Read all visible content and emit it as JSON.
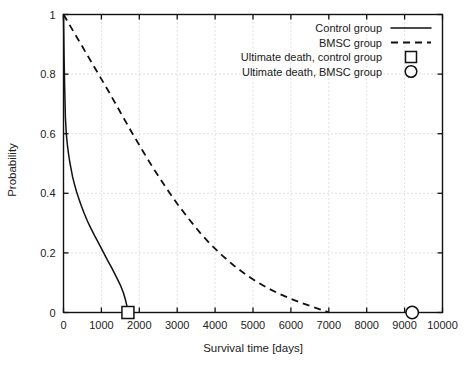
{
  "chart_data": {
    "type": "line",
    "title": "",
    "xlabel": "Survival time [days]",
    "ylabel": "Probability",
    "xlim": [
      0,
      10000
    ],
    "ylim": [
      0,
      1
    ],
    "grid": true,
    "legend_position": "top-right",
    "xticks": [
      0,
      1000,
      2000,
      3000,
      4000,
      5000,
      6000,
      7000,
      8000,
      9000,
      10000
    ],
    "xtick_labels": [
      "0",
      "1000",
      "2000",
      "3000",
      "4000",
      "5000",
      "6000",
      "7000",
      "8000",
      "9000",
      "10000"
    ],
    "yticks": [
      0,
      0.2,
      0.4,
      0.6,
      0.8,
      1
    ],
    "ytick_labels": [
      "0",
      "0.2",
      "0.4",
      "0.6",
      "0.8",
      "1"
    ],
    "series": [
      {
        "name": "Control group",
        "style": "solid",
        "x": [
          0,
          15,
          30,
          50,
          75,
          100,
          130,
          165,
          200,
          240,
          290,
          345,
          405,
          470,
          545,
          630,
          720,
          820,
          930,
          1040,
          1160,
          1280,
          1400,
          1500,
          1580,
          1640,
          1680,
          1700
        ],
        "y": [
          1.0,
          0.86,
          0.76,
          0.655,
          0.598,
          0.565,
          0.535,
          0.505,
          0.482,
          0.455,
          0.43,
          0.405,
          0.382,
          0.358,
          0.333,
          0.307,
          0.283,
          0.258,
          0.232,
          0.205,
          0.176,
          0.148,
          0.118,
          0.092,
          0.066,
          0.04,
          0.018,
          0.0
        ]
      },
      {
        "name": "BMSC group",
        "style": "dashed",
        "x": [
          0,
          300,
          600,
          900,
          1200,
          1500,
          1800,
          2100,
          2400,
          2700,
          3000,
          3300,
          3600,
          3900,
          4200,
          4500,
          4800,
          5100,
          5400,
          5700,
          6000,
          6300,
          6600,
          6900,
          7000
        ],
        "y": [
          1.0,
          0.935,
          0.87,
          0.805,
          0.74,
          0.672,
          0.605,
          0.54,
          0.478,
          0.42,
          0.365,
          0.315,
          0.268,
          0.226,
          0.19,
          0.157,
          0.128,
          0.103,
          0.081,
          0.062,
          0.046,
          0.031,
          0.018,
          0.005,
          0.0
        ]
      }
    ],
    "markers": [
      {
        "name": "Ultimate death, control group",
        "shape": "square",
        "x": 1700,
        "y": 0
      },
      {
        "name": "Ultimate death, BMSC group",
        "shape": "circle",
        "x": 9200,
        "y": 0
      }
    ],
    "legend": [
      {
        "label": "Control group",
        "sample": "solid-line"
      },
      {
        "label": "BMSC group",
        "sample": "dashed-line"
      },
      {
        "label": "Ultimate death, control group",
        "sample": "open-square"
      },
      {
        "label": "Ultimate death, BMSC group",
        "sample": "open-circle"
      }
    ]
  },
  "colors": {
    "ink": "#111111",
    "grid": "#b5b5b5",
    "background": "#ffffff"
  }
}
